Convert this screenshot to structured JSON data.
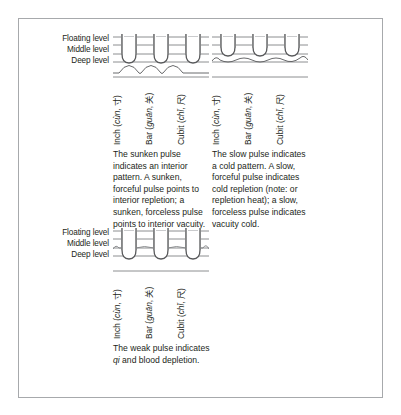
{
  "figure": {
    "levels": [
      "Floating level",
      "Middle level",
      "Deep level"
    ],
    "positions": [
      {
        "name": "Inch",
        "pinyin": "cùn",
        "hanzi": "寸"
      },
      {
        "name": "Bar",
        "pinyin": "guān",
        "hanzi": "关"
      },
      {
        "name": "Cubit",
        "pinyin": "chǐ",
        "hanzi": "尺"
      }
    ],
    "panels": [
      {
        "id": "sunken",
        "title": "sunken-pulse-diagram",
        "caption": "The sunken pulse indicates an interior pattern. A sunken, forceful pulse points to interior repletion; a sunken, forceless pulse points to interior vacuity."
      },
      {
        "id": "slow",
        "title": "slow-pulse-diagram",
        "caption": "The slow pulse indicates a cold pattern. A slow, forceful pulse indicates cold repletion (note: or repletion heat); a slow, forceless pulse indicates vacuity cold."
      },
      {
        "id": "weak",
        "title": "weak-pulse-diagram",
        "caption_before": "The weak pulse indicates ",
        "caption_italic": "qi",
        "caption_after": " and blood depletion."
      }
    ],
    "colors": {
      "line": "#808285",
      "finger_fill": "#d9d9d9",
      "finger_stroke": "#58595b",
      "border": "#a7a9ac",
      "text": "#231f20"
    }
  }
}
